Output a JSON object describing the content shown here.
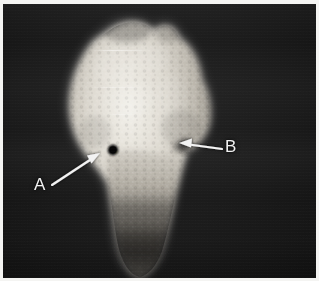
{
  "figure": {
    "type": "grayscale-specimen-radiograph",
    "alt_description": "Grayscale radiographic image of a bone specimen head and shaft on a dark background with two white annotation arrows labelled A and B",
    "background_color": "#0d0d0d",
    "frame_color": "#f4f4f2",
    "annotation_color": "#f2f2f2",
    "specimen_color": "#e8e6e0",
    "defect_color": "#0a0a0a",
    "panel": {
      "x": 3,
      "y": 4,
      "width": 313,
      "height": 274
    }
  },
  "annotations": [
    {
      "id": "a",
      "label": "A",
      "label_x": 31,
      "label_y": 172,
      "arrow_tail": {
        "x": 52,
        "y": 181
      },
      "arrow_head": {
        "x": 97,
        "y": 151
      },
      "points_to": "dark circular cortical defect",
      "color": "#f2f2f2"
    },
    {
      "id": "b",
      "label": "B",
      "label_x": 222,
      "label_y": 134,
      "arrow_tail": {
        "x": 219,
        "y": 145
      },
      "arrow_head": {
        "x": 176,
        "y": 140
      },
      "points_to": "notch in lateral specimen margin",
      "color": "#f2f2f2"
    }
  ],
  "features": {
    "defect": {
      "cx": 110,
      "cy": 146,
      "r": 5.2,
      "label": "dark circular defect"
    },
    "specimen_head": {
      "label": "bright flared proximal head"
    },
    "specimen_shaft": {
      "label": "tapering distal shaft fading into background"
    },
    "notch": {
      "x": 172,
      "y": 141,
      "label": "lateral margin notch"
    }
  }
}
